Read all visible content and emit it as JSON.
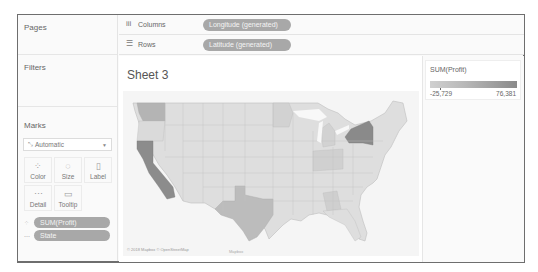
{
  "left_panel": {
    "pages_title": "Pages",
    "filters_title": "Filters",
    "marks_title": "Marks",
    "mark_type": "Automatic",
    "mark_type_icon": "automatic-mark-icon",
    "mark_buttons": [
      {
        "label": "Color",
        "icon": "color-icon",
        "glyph": "⁘"
      },
      {
        "label": "Size",
        "icon": "size-icon",
        "glyph": "◌"
      },
      {
        "label": "Label",
        "icon": "label-icon",
        "glyph": "▯"
      },
      {
        "label": "Detail",
        "icon": "detail-icon",
        "glyph": "⋯"
      },
      {
        "label": "Tooltip",
        "icon": "tooltip-icon",
        "glyph": "▭"
      }
    ],
    "mark_pills": [
      {
        "label": "SUM(Profit)",
        "icon": "color-icon",
        "glyph": "⁘"
      },
      {
        "label": "State",
        "icon": "detail-icon",
        "glyph": "⋯"
      }
    ]
  },
  "shelves": {
    "columns": {
      "label": "Columns",
      "icon": "columns-icon",
      "glyph": "iii",
      "pill": "Longitude (generated)"
    },
    "rows": {
      "label": "Rows",
      "icon": "rows-icon",
      "glyph": "☰",
      "pill": "Latitude (generated)"
    }
  },
  "view": {
    "sheet_title": "Sheet 3",
    "attribution": "© 2018 Mapbox © OpenStreetMap",
    "bottom_label": "Mapbox"
  },
  "legend": {
    "title": "SUM(Profit)",
    "min": "-25,729",
    "max": "76,381",
    "color_low": "#d0d0d0",
    "color_high": "#8a8a8a"
  }
}
